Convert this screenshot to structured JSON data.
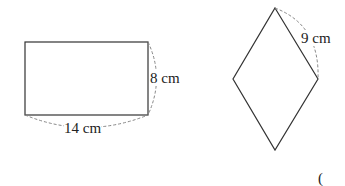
{
  "rectangle": {
    "width_label": "14 cm",
    "height_label": "8 cm"
  },
  "rhombus": {
    "side_label": "9 cm"
  },
  "answer_bracket": "("
}
